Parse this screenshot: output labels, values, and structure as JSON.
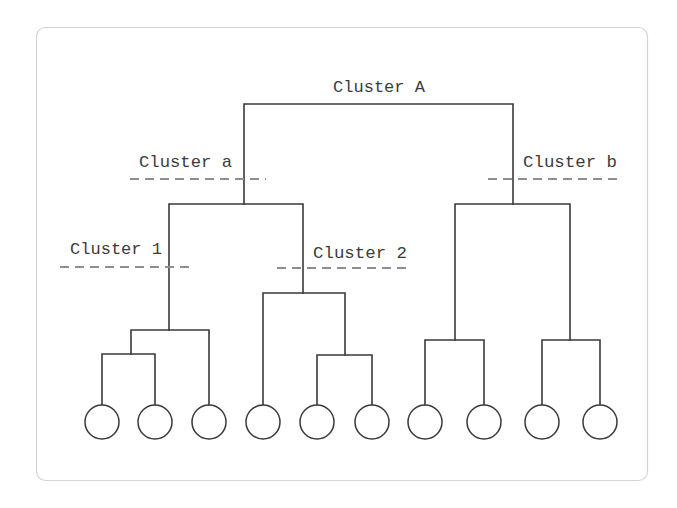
{
  "diagram": {
    "type": "dendrogram",
    "colors": {
      "frame_border": "#d4d4d4",
      "branch": "#3a3a3a",
      "cut_line": "#8e8e8e",
      "label": "#3c3c3c"
    },
    "labels": {
      "cluster_A": "Cluster A",
      "cluster_a": "Cluster a",
      "cluster_b": "Cluster b",
      "cluster_1": "Cluster 1",
      "cluster_2": "Cluster 2"
    },
    "leaf_count": 10,
    "leaves": [
      {
        "id": 1,
        "group": "Cluster 1"
      },
      {
        "id": 2,
        "group": "Cluster 1"
      },
      {
        "id": 3,
        "group": "Cluster 1"
      },
      {
        "id": 4,
        "group": "Cluster 2"
      },
      {
        "id": 5,
        "group": "Cluster 2"
      },
      {
        "id": 6,
        "group": "Cluster 2"
      },
      {
        "id": 7,
        "group": "Cluster b"
      },
      {
        "id": 8,
        "group": "Cluster b"
      },
      {
        "id": 9,
        "group": "Cluster b"
      },
      {
        "id": 10,
        "group": "Cluster b"
      }
    ],
    "hierarchy": {
      "name": "Cluster A",
      "children": [
        {
          "name": "Cluster a",
          "children": [
            {
              "name": "Cluster 1",
              "leaves": [
                1,
                2,
                3
              ]
            },
            {
              "name": "Cluster 2",
              "leaves": [
                4,
                5,
                6
              ]
            }
          ]
        },
        {
          "name": "Cluster b",
          "leaves": [
            7,
            8,
            9,
            10
          ]
        }
      ]
    }
  }
}
